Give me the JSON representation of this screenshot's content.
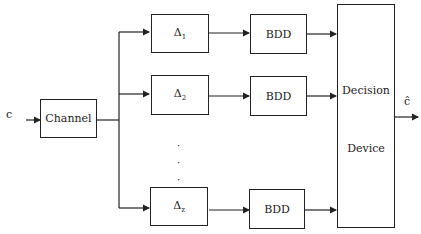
{
  "diagram": {
    "input_label": "c",
    "output_label": "ĉ",
    "channel": "Channel",
    "branches": [
      {
        "delta": "Δ",
        "sub": "1",
        "decoder": "BDD"
      },
      {
        "delta": "Δ",
        "sub": "2",
        "decoder": "BDD"
      },
      {
        "delta": "Δ",
        "sub": "z",
        "decoder": "BDD"
      }
    ],
    "ellipsis": [
      "·",
      "·",
      "·"
    ],
    "decision_top": "Decision",
    "decision_bottom": "Device"
  }
}
